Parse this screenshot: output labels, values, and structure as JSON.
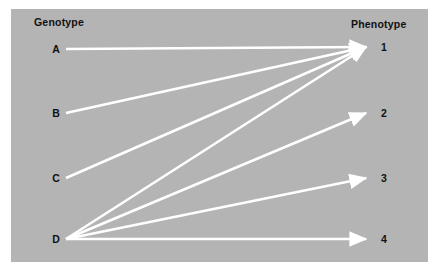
{
  "figure": {
    "background_color": "#ffffff",
    "canvas_color": "#b4b4b4",
    "edge_color": "#ffffff",
    "text_color": "#111111"
  },
  "headers": {
    "left": "Genotype",
    "right": "Phenotype"
  },
  "genotypes": [
    {
      "id": "A",
      "label": "A",
      "x": 56,
      "y": 49
    },
    {
      "id": "B",
      "label": "B",
      "x": 56,
      "y": 113
    },
    {
      "id": "C",
      "label": "C",
      "x": 56,
      "y": 178
    },
    {
      "id": "D",
      "label": "D",
      "x": 56,
      "y": 239
    }
  ],
  "phenotypes": [
    {
      "id": "1",
      "label": "1",
      "x": 384,
      "y": 47
    },
    {
      "id": "2",
      "label": "2",
      "x": 384,
      "y": 113
    },
    {
      "id": "3",
      "label": "3",
      "x": 384,
      "y": 178
    },
    {
      "id": "4",
      "label": "4",
      "x": 384,
      "y": 239
    }
  ],
  "edges": [
    {
      "from": "A",
      "to": "1"
    },
    {
      "from": "B",
      "to": "1"
    },
    {
      "from": "C",
      "to": "1"
    },
    {
      "from": "D",
      "to": "1"
    },
    {
      "from": "D",
      "to": "2"
    },
    {
      "from": "D",
      "to": "3"
    },
    {
      "from": "D",
      "to": "4"
    }
  ]
}
